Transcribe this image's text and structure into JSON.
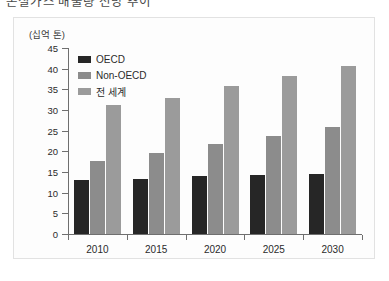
{
  "caption": {
    "text": "온실가스 배출량 전망 추이"
  },
  "chart_data": {
    "type": "bar",
    "title": "",
    "subtitle": "",
    "xlabel": "",
    "ylabel": "(십억 톤)",
    "unit_label": "(십억 톤)",
    "categories": [
      "2010",
      "2015",
      "2020",
      "2025",
      "2030"
    ],
    "series": [
      {
        "name": "OECD",
        "color": "#262626",
        "values": [
          13.1,
          13.2,
          14.0,
          14.2,
          14.5
        ]
      },
      {
        "name": "Non-OECD",
        "color": "#8c8c8c",
        "values": [
          17.7,
          19.5,
          21.7,
          23.8,
          25.9
        ]
      },
      {
        "name": "전 세계",
        "color": "#9b9b9b",
        "values": [
          31.2,
          32.9,
          35.7,
          38.3,
          40.6
        ]
      }
    ],
    "ylim": [
      0,
      45
    ],
    "ytick_step": 5,
    "yticks": [
      "45",
      "40",
      "35",
      "30",
      "25",
      "20",
      "15",
      "10",
      "5",
      "0"
    ],
    "grid": false,
    "legend_position": "top-left"
  },
  "colors": {
    "oecd": "#262626",
    "non_oecd": "#8c8c8c",
    "world": "#9b9b9b",
    "axis": "#6f6f6f",
    "card_border": "#e2e2e2",
    "card_bg": "#fdfdfd",
    "text": "#2b2b2b"
  }
}
